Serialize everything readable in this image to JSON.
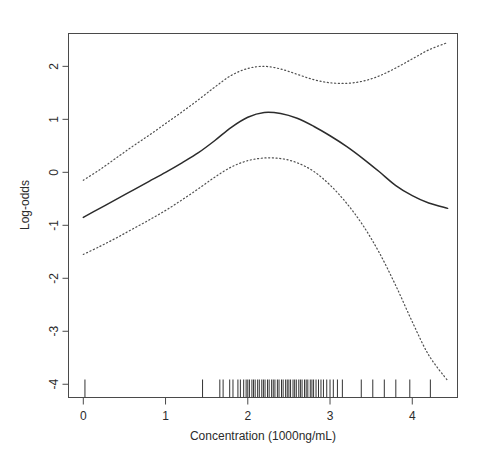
{
  "chart_data": {
    "type": "line",
    "title": "",
    "subtitle": "",
    "xlabel": "Concentration (1000ng/mL)",
    "ylabel": "Log-odds",
    "xlim": [
      -0.18,
      4.55
    ],
    "ylim": [
      -4.25,
      2.62
    ],
    "xticks": [
      0,
      1,
      2,
      3,
      4
    ],
    "xtick_labels": [
      "0",
      "1",
      "2",
      "3",
      "4"
    ],
    "yticks": [
      2,
      1,
      0,
      -1,
      -2,
      -3,
      -4
    ],
    "ytick_labels": [
      "2",
      "1",
      "0",
      "-1",
      "-2",
      "-3",
      "-4"
    ],
    "grid": false,
    "legend": "none",
    "box": true,
    "series": [
      {
        "name": "Fitted log-odds",
        "style": "solid",
        "color": "#2c2c2c",
        "x": [
          0.0,
          0.2,
          0.4,
          0.6,
          0.8,
          1.0,
          1.2,
          1.4,
          1.6,
          1.8,
          2.0,
          2.2,
          2.4,
          2.6,
          2.8,
          3.0,
          3.2,
          3.4,
          3.6,
          3.8,
          4.0,
          4.2,
          4.43
        ],
        "values": [
          -0.85,
          -0.68,
          -0.51,
          -0.34,
          -0.17,
          0.0,
          0.18,
          0.37,
          0.6,
          0.85,
          1.04,
          1.13,
          1.11,
          1.02,
          0.87,
          0.69,
          0.49,
          0.26,
          0.01,
          -0.25,
          -0.44,
          -0.58,
          -0.68
        ]
      },
      {
        "name": "Upper 95% confidence band",
        "style": "dotted",
        "color": "#4f4f4f",
        "x": [
          0.0,
          0.2,
          0.4,
          0.6,
          0.8,
          1.0,
          1.2,
          1.4,
          1.6,
          1.8,
          2.0,
          2.2,
          2.4,
          2.6,
          2.8,
          3.0,
          3.2,
          3.4,
          3.6,
          3.8,
          4.0,
          4.2,
          4.43
        ],
        "values": [
          -0.15,
          0.05,
          0.27,
          0.49,
          0.7,
          0.92,
          1.14,
          1.37,
          1.61,
          1.83,
          1.96,
          2.0,
          1.95,
          1.85,
          1.75,
          1.69,
          1.68,
          1.72,
          1.82,
          1.97,
          2.14,
          2.31,
          2.45
        ]
      },
      {
        "name": "Lower 95% confidence band",
        "style": "dotted",
        "color": "#4f4f4f",
        "x": [
          0.0,
          0.2,
          0.4,
          0.6,
          0.8,
          1.0,
          1.2,
          1.4,
          1.6,
          1.8,
          2.0,
          2.2,
          2.4,
          2.6,
          2.8,
          3.0,
          3.2,
          3.4,
          3.6,
          3.8,
          4.0,
          4.2,
          4.43
        ],
        "values": [
          -1.55,
          -1.4,
          -1.24,
          -1.07,
          -0.9,
          -0.72,
          -0.52,
          -0.31,
          -0.09,
          0.1,
          0.22,
          0.27,
          0.26,
          0.18,
          0.02,
          -0.24,
          -0.58,
          -1.0,
          -1.52,
          -2.14,
          -2.82,
          -3.45,
          -3.93
        ]
      }
    ],
    "rug": {
      "name": "Observed concentrations",
      "axis": "x",
      "values": [
        0.02,
        1.45,
        1.66,
        1.7,
        1.78,
        1.82,
        1.88,
        1.91,
        1.95,
        1.98,
        2.0,
        2.02,
        2.05,
        2.07,
        2.09,
        2.12,
        2.14,
        2.17,
        2.19,
        2.21,
        2.24,
        2.26,
        2.29,
        2.31,
        2.33,
        2.36,
        2.38,
        2.41,
        2.43,
        2.46,
        2.48,
        2.5,
        2.52,
        2.55,
        2.57,
        2.59,
        2.62,
        2.64,
        2.66,
        2.69,
        2.71,
        2.73,
        2.76,
        2.78,
        2.8,
        2.83,
        2.86,
        2.89,
        2.92,
        2.96,
        3.0,
        3.04,
        3.09,
        3.15,
        3.38,
        3.52,
        3.66,
        3.8,
        3.97,
        4.22
      ]
    }
  },
  "axes": {
    "x_title": "Concentration (1000ng/mL)",
    "y_title": "Log-odds"
  }
}
